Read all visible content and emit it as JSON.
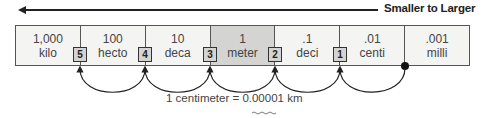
{
  "header": {
    "title": "Smaller to Larger",
    "arrow_direction": "left"
  },
  "units": [
    {
      "value": "1,000",
      "prefix": "kilo",
      "highlight": false
    },
    {
      "value": "100",
      "prefix": "hecto",
      "highlight": false
    },
    {
      "value": "10",
      "prefix": "deca",
      "highlight": false
    },
    {
      "value": "1",
      "prefix": "meter",
      "highlight": true
    },
    {
      "value": ".1",
      "prefix": "deci",
      "highlight": false
    },
    {
      "value": ".01",
      "prefix": "centi",
      "highlight": false
    },
    {
      "value": ".001",
      "prefix": "milli",
      "highlight": false
    }
  ],
  "steps": [
    "5",
    "4",
    "3",
    "2",
    "1"
  ],
  "caption": {
    "text": "1 centimeter = 0.00001 km",
    "underlined": "00001"
  },
  "colors": {
    "highlight": "#d4d4d2",
    "cell": "#f4f4f3",
    "line": "#222222"
  }
}
